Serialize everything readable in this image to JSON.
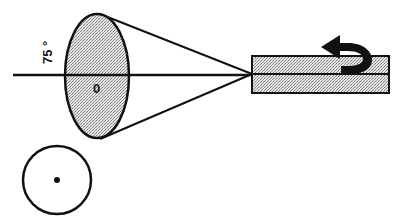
{
  "diagram": {
    "labels": {
      "angle": "75 °",
      "center": "0"
    },
    "colors": {
      "stroke": "#111111",
      "fill_shaded": "#c8c8c8",
      "background": "#ffffff"
    },
    "elements": {
      "axis_line": {
        "x1": 13,
        "y1": 75,
        "x2": 252,
        "y2": 75
      },
      "cone_ellipse": {
        "cx": 97,
        "cy": 76,
        "rx": 32,
        "ry": 62
      },
      "cone_apex": {
        "x": 252,
        "y": 74
      },
      "bar": {
        "x": 252,
        "y": 56,
        "width": 137,
        "height": 37,
        "mid_y": 74
      },
      "rotation_arrow": {
        "direction": "counter-clockwise"
      },
      "small_circle": {
        "cx": 57,
        "cy": 180,
        "r": 34,
        "dot_r": 3
      }
    }
  }
}
